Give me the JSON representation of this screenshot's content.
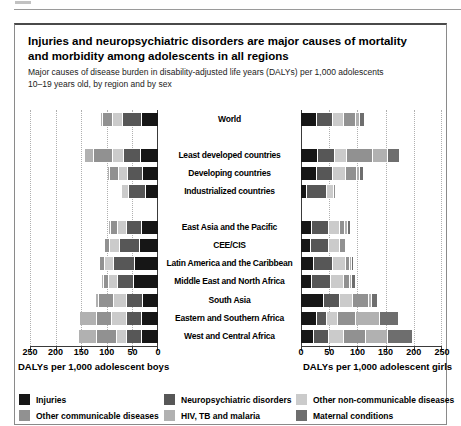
{
  "figure": {
    "title_line1": "Injuries and neuropsychiatric disorders are major causes of mortality",
    "title_line2": "and morbidity among adolescents in all regions",
    "subtitle_line1": "Major causes of disease burden in disability-adjusted life years (DALYs) per 1,000 adolescents",
    "subtitle_line2": "10–19 years old, by region and by sex"
  },
  "chart_data": {
    "type": "bar",
    "variant": "horizontal-stacked, mirrored (boys left, girls right)",
    "grid": "dotted vertical gridlines every 50",
    "axis": {
      "min": 0,
      "max": 250,
      "ticks": [
        0,
        50,
        100,
        150,
        200,
        250
      ],
      "left_label": "DALYs per 1,000 adolescent boys",
      "right_label": "DALYs per 1,000 adolescent girls"
    },
    "categories": [
      {
        "key": "injuries",
        "label": "Injuries",
        "color": "#161616"
      },
      {
        "key": "neuropsychiatric",
        "label": "Neuropsychiatric disorders",
        "color": "#575757"
      },
      {
        "key": "other_ncd",
        "label": "Other non-communicable diseases",
        "color": "#cbcbcb"
      },
      {
        "key": "other_communicable",
        "label": "Other communicable diseases",
        "color": "#919191"
      },
      {
        "key": "hiv_tb_malaria",
        "label": "HIV, TB and malaria",
        "color": "#b1b1b1"
      },
      {
        "key": "maternal",
        "label": "Maternal conditions",
        "color": "#6e6e6e"
      }
    ],
    "value_order_note": "values arrays follow categories order; stacking starts at 0 with injuries",
    "regions": [
      {
        "label": "World",
        "new_group": false,
        "boys": [
          33,
          37,
          19,
          20,
          4,
          0
        ],
        "girls": [
          28,
          29,
          20,
          21,
          7,
          8
        ]
      },
      {
        "label": "Least developed countries",
        "new_group": true,
        "boys": [
          35,
          33,
          21,
          38,
          18,
          0
        ],
        "girls": [
          31,
          30,
          20,
          46,
          27,
          21
        ]
      },
      {
        "label": "Developing countries",
        "new_group": false,
        "boys": [
          31,
          30,
          18,
          17,
          2,
          0
        ],
        "girls": [
          28,
          28,
          23,
          20,
          6,
          7
        ]
      },
      {
        "label": "Industrialized countries",
        "new_group": false,
        "boys": [
          25,
          33,
          14,
          0,
          0,
          0
        ],
        "girls": [
          10,
          37,
          12,
          2,
          0,
          0
        ]
      },
      {
        "label": "East Asia and the Pacific",
        "new_group": true,
        "boys": [
          33,
          30,
          17,
          13,
          2,
          0
        ],
        "girls": [
          20,
          30,
          19,
          9,
          5,
          5
        ]
      },
      {
        "label": "CEE/CIS",
        "new_group": false,
        "boys": [
          37,
          40,
          18,
          10,
          0,
          0
        ],
        "girls": [
          17,
          33,
          19,
          10,
          0,
          0
        ]
      },
      {
        "label": "Latin America and the Caribbean",
        "new_group": false,
        "boys": [
          46,
          42,
          17,
          11,
          0,
          0
        ],
        "girls": [
          23,
          33,
          23,
          8,
          2,
          3
        ]
      },
      {
        "label": "Middle East and North Africa",
        "new_group": false,
        "boys": [
          49,
          31,
          17,
          11,
          2,
          0
        ],
        "girls": [
          20,
          33,
          23,
          11,
          4,
          6
        ]
      },
      {
        "label": "South Asia",
        "new_group": false,
        "boys": [
          31,
          31,
          26,
          30,
          6,
          0
        ],
        "girls": [
          40,
          29,
          24,
          27,
          6,
          11
        ]
      },
      {
        "label": "Eastern and Southern Africa",
        "new_group": false,
        "boys": [
          33,
          30,
          29,
          29,
          33,
          0
        ],
        "girls": [
          29,
          18,
          19,
          31,
          44,
          32
        ]
      },
      {
        "label": "West and Central Africa",
        "new_group": false,
        "boys": [
          33,
          30,
          20,
          38,
          36,
          0
        ],
        "girls": [
          23,
          27,
          26,
          40,
          38,
          44
        ]
      }
    ]
  },
  "legend": {
    "columns": [
      [
        "injuries",
        "other_communicable"
      ],
      [
        "neuropsychiatric",
        "hiv_tb_malaria"
      ],
      [
        "other_ncd",
        "maternal"
      ]
    ]
  }
}
